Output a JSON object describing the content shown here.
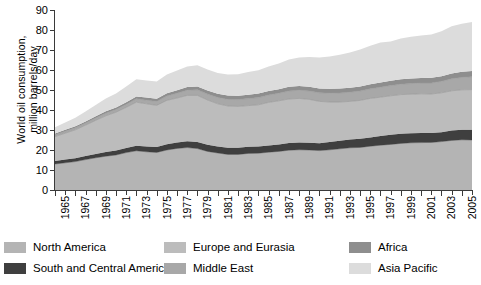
{
  "chart_data": {
    "type": "area",
    "stacked": true,
    "title": "",
    "xlabel": "",
    "ylabel": "World oil consumption,\nmillion barrels/day",
    "ylim": [
      0,
      90
    ],
    "yticks": [
      0,
      10,
      20,
      30,
      40,
      50,
      60,
      70,
      80,
      90
    ],
    "xlim": [
      1965,
      2006
    ],
    "grid": false,
    "legend_position": "bottom",
    "x": [
      1965,
      1966,
      1967,
      1968,
      1969,
      1970,
      1971,
      1972,
      1973,
      1974,
      1975,
      1976,
      1977,
      1978,
      1979,
      1980,
      1981,
      1982,
      1983,
      1984,
      1985,
      1986,
      1987,
      1988,
      1989,
      1990,
      1991,
      1992,
      1993,
      1994,
      1995,
      1996,
      1997,
      1998,
      1999,
      2000,
      2001,
      2002,
      2003,
      2004,
      2005,
      2006
    ],
    "tick_labels": [
      "1965",
      "1967",
      "1969",
      "1971",
      "1973",
      "1975",
      "1977",
      "1979",
      "1981",
      "1983",
      "1985",
      "1987",
      "1989",
      "1991",
      "1993",
      "1995",
      "1997",
      "1999",
      "2001",
      "2003",
      "2005"
    ],
    "series": [
      {
        "name": "North America",
        "color": "#b4b4b4",
        "values": [
          13.0,
          13.6,
          14.2,
          15.2,
          16.1,
          16.9,
          17.5,
          18.7,
          19.6,
          19.1,
          18.8,
          20.0,
          20.8,
          21.2,
          20.7,
          19.3,
          18.5,
          17.8,
          17.8,
          18.3,
          18.4,
          18.9,
          19.3,
          19.9,
          20.1,
          20.0,
          19.7,
          20.1,
          20.6,
          21.1,
          21.3,
          21.9,
          22.4,
          22.8,
          23.3,
          23.6,
          23.7,
          23.8,
          24.2,
          24.8,
          25.1,
          25.0
        ]
      },
      {
        "name": "South and Central America",
        "color": "#3f3f3f",
        "values": [
          1.5,
          1.6,
          1.7,
          1.8,
          1.9,
          2.1,
          2.2,
          2.3,
          2.5,
          2.6,
          2.7,
          2.9,
          3.0,
          3.2,
          3.3,
          3.3,
          3.3,
          3.3,
          3.3,
          3.3,
          3.3,
          3.4,
          3.5,
          3.6,
          3.6,
          3.6,
          3.7,
          3.9,
          4.0,
          4.1,
          4.3,
          4.4,
          4.6,
          4.8,
          4.8,
          4.8,
          4.8,
          4.7,
          4.7,
          4.9,
          5.0,
          5.1
        ]
      },
      {
        "name": "Europe and Eurasia",
        "color": "#bcbcbc",
        "values": [
          12.2,
          13.2,
          14.2,
          15.4,
          16.8,
          18.1,
          19.2,
          20.3,
          21.8,
          21.4,
          20.8,
          21.9,
          22.2,
          22.9,
          23.3,
          22.4,
          21.3,
          20.9,
          20.7,
          20.6,
          20.9,
          21.5,
          21.8,
          22.0,
          22.1,
          21.7,
          20.9,
          20.0,
          19.4,
          19.1,
          19.2,
          19.5,
          19.4,
          19.5,
          19.6,
          19.5,
          19.6,
          19.5,
          19.7,
          19.9,
          20.0,
          20.1
        ]
      },
      {
        "name": "Middle East",
        "color": "#a8a8a8",
        "values": [
          0.9,
          1.0,
          1.0,
          1.1,
          1.2,
          1.3,
          1.4,
          1.5,
          1.7,
          1.8,
          2.0,
          2.2,
          2.4,
          2.6,
          2.8,
          3.0,
          3.2,
          3.3,
          3.4,
          3.5,
          3.6,
          3.7,
          3.8,
          4.0,
          4.1,
          4.2,
          4.3,
          4.4,
          4.5,
          4.6,
          4.7,
          4.8,
          5.0,
          5.1,
          5.2,
          5.3,
          5.4,
          5.5,
          5.7,
          6.0,
          6.2,
          6.4
        ]
      },
      {
        "name": "Africa",
        "color": "#8e8e8e",
        "values": [
          0.7,
          0.7,
          0.8,
          0.8,
          0.9,
          1.0,
          1.0,
          1.1,
          1.2,
          1.3,
          1.3,
          1.4,
          1.5,
          1.6,
          1.7,
          1.8,
          1.8,
          1.9,
          1.9,
          1.9,
          2.0,
          2.0,
          2.0,
          2.1,
          2.1,
          2.1,
          2.2,
          2.2,
          2.2,
          2.2,
          2.3,
          2.3,
          2.4,
          2.4,
          2.5,
          2.5,
          2.5,
          2.6,
          2.6,
          2.7,
          2.8,
          2.9
        ]
      },
      {
        "name": "Asia Pacific",
        "color": "#dcdcdc",
        "values": [
          3.1,
          3.6,
          4.2,
          4.9,
          5.6,
          6.4,
          7.0,
          7.8,
          8.6,
          8.5,
          8.6,
          9.3,
          9.8,
          10.3,
          10.6,
          10.5,
          10.4,
          10.5,
          10.8,
          11.4,
          11.7,
          12.2,
          12.8,
          13.6,
          14.3,
          14.9,
          15.5,
          16.2,
          16.9,
          17.7,
          18.4,
          19.2,
          19.9,
          19.6,
          20.3,
          20.9,
          21.2,
          21.7,
          22.5,
          23.6,
          24.0,
          24.5
        ]
      }
    ]
  },
  "legend": {
    "items": [
      {
        "label": "North America",
        "color": "#b4b4b4"
      },
      {
        "label": "South and Central America",
        "color": "#3f3f3f"
      },
      {
        "label": "Europe and Eurasia",
        "color": "#bcbcbc"
      },
      {
        "label": "Middle East",
        "color": "#a8a8a8"
      },
      {
        "label": "Africa",
        "color": "#8e8e8e"
      },
      {
        "label": "Asia Pacific",
        "color": "#dcdcdc"
      }
    ]
  }
}
